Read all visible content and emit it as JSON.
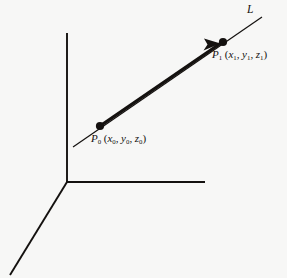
{
  "figure": {
    "background_color": "#f7f7f6",
    "ink_color": "#14110f",
    "axes": {
      "name": "coordinate-axes",
      "origin": {
        "x": 67,
        "y": 182
      },
      "stroke_width": 1.9,
      "y_axis": {
        "label": "",
        "from": {
          "x": 67,
          "y": 33
        },
        "to": {
          "x": 67,
          "y": 182
        }
      },
      "x_axis": {
        "label": "",
        "from": {
          "x": 67,
          "y": 182
        },
        "to": {
          "x": 205,
          "y": 182
        }
      },
      "z_axis": {
        "label": "",
        "from": {
          "x": 67,
          "y": 182
        },
        "to": {
          "x": 10,
          "y": 275
        }
      }
    },
    "line": {
      "name": "line-L",
      "label": "L",
      "thin_stroke_width": 1.2,
      "thick_stroke_width": 3.2,
      "tail_tip": {
        "x": 73,
        "y": 147
      },
      "head_tip": {
        "x": 262,
        "y": 17
      },
      "segment_from": {
        "x": 100,
        "y": 126
      },
      "segment_to": {
        "x": 223,
        "y": 42
      }
    },
    "arrow": {
      "name": "direction-arrowhead",
      "tip": {
        "x": 219,
        "y": 45
      },
      "length": 17,
      "half_width": 5
    },
    "points": [
      {
        "name": "point-p0",
        "cx": 100,
        "cy": 126,
        "r": 4.1,
        "symbol": "P",
        "index": "0",
        "coords": [
          "x",
          "y",
          "z"
        ],
        "coord_index": "0",
        "label_text": "P0 (x0, y0, z0)"
      },
      {
        "name": "point-p1",
        "cx": 223,
        "cy": 42,
        "r": 4.1,
        "symbol": "P",
        "index": "1",
        "coords": [
          "x",
          "y",
          "z"
        ],
        "coord_index": "1",
        "label_text": "P1 (x1, y1, z1)"
      }
    ],
    "labels": {
      "line_label": "L",
      "p1": {
        "symbol": "P",
        "sub": "1",
        "open_paren": "(",
        "x": "x",
        "y": "y",
        "z": "z",
        "comma": ",",
        "close_paren": ")"
      },
      "p0": {
        "symbol": "P",
        "sub": "0",
        "open_paren": "(",
        "x": "x",
        "y": "y",
        "z": "z",
        "comma": ",",
        "close_paren": ")"
      }
    }
  }
}
